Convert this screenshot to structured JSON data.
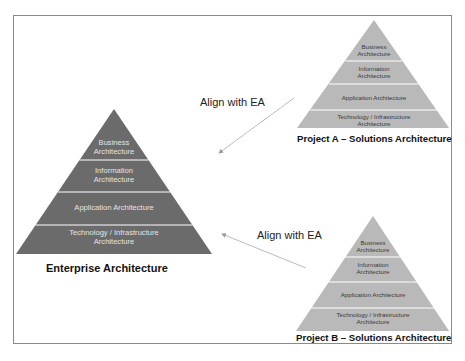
{
  "colors": {
    "enterprise_fill": "#6b6b6b",
    "project_fill": "#b9b9b9",
    "divider": "#ffffff",
    "frame_border": "#8a8a8a",
    "arrow": "#9a9a9a"
  },
  "enterprise": {
    "caption": "Enterprise Architecture",
    "layers": [
      {
        "line1": "Business",
        "line2": "Architecture"
      },
      {
        "line1": "Information",
        "line2": "Architecture"
      },
      {
        "line1": "Application Architecture",
        "line2": ""
      },
      {
        "line1": "Technology / Infrastructure",
        "line2": "Architecture"
      }
    ]
  },
  "project_a": {
    "caption": "Project A – Solutions Architecture",
    "layers": [
      {
        "line1": "Business",
        "line2": "Architecture"
      },
      {
        "line1": "Information",
        "line2": "Architecture"
      },
      {
        "line1": "Application Architecture",
        "line2": ""
      },
      {
        "line1": "Technology / Infrastructure",
        "line2": "Architecture"
      }
    ]
  },
  "project_b": {
    "caption": "Project B – Solutions Architecture",
    "layers": [
      {
        "line1": "Business",
        "line2": "Architecture"
      },
      {
        "line1": "Information",
        "line2": "Architecture"
      },
      {
        "line1": "Application Architecture",
        "line2": ""
      },
      {
        "line1": "Technology / Infrastructure",
        "line2": "Architecture"
      }
    ]
  },
  "arrows": {
    "top_label": "Align with EA",
    "bottom_label": "Align with EA"
  }
}
